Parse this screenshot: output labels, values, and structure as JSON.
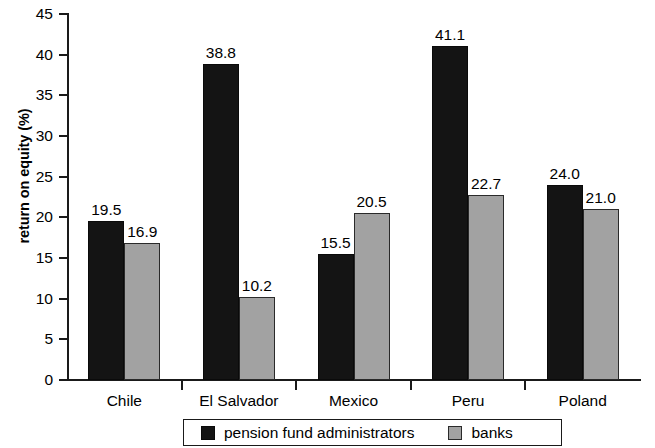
{
  "chart_data": {
    "type": "bar",
    "title": "",
    "subtitle": "",
    "xlabel": "",
    "ylabel": "return on equity (%)",
    "ylim": [
      0,
      45
    ],
    "yticks": [
      0,
      5,
      10,
      15,
      20,
      25,
      30,
      35,
      40,
      45
    ],
    "ytick_labels": [
      "0",
      "5",
      "10",
      "15",
      "20",
      "25",
      "30",
      "35",
      "40",
      "45"
    ],
    "grid": false,
    "legend_position": "bottom-center",
    "categories": [
      "Chile",
      "El Salvador",
      "Mexico",
      "Peru",
      "Poland"
    ],
    "series": [
      {
        "name": "pension fund administrators",
        "color": "#141414",
        "values": [
          19.5,
          38.8,
          15.5,
          41.1,
          24.0
        ],
        "value_labels": [
          "19.5",
          "38.8",
          "15.5",
          "41.1",
          "24.0"
        ]
      },
      {
        "name": "banks",
        "color": "#a2a2a2",
        "values": [
          16.9,
          10.2,
          20.5,
          22.7,
          21.0
        ],
        "value_labels": [
          "16.9",
          "10.2",
          "20.5",
          "22.7",
          "21.0"
        ]
      }
    ]
  },
  "legend": {
    "entries": [
      {
        "label": "pension fund administrators",
        "swatch": "black-square-swatch"
      },
      {
        "label": "banks",
        "swatch": "gray-square-swatch"
      }
    ]
  },
  "axis": {
    "y_title": "return on equity (%)",
    "y_tick_labels": [
      "45",
      "40",
      "35",
      "30",
      "25",
      "20",
      "15",
      "10",
      "5",
      "0"
    ],
    "x_tick_labels": [
      "Chile",
      "El Salvador",
      "Mexico",
      "Peru",
      "Poland"
    ]
  },
  "colors": {
    "series_black": "#141414",
    "series_gray": "#a2a2a2",
    "axis": "#1a1a1a",
    "background": "#ffffff"
  }
}
